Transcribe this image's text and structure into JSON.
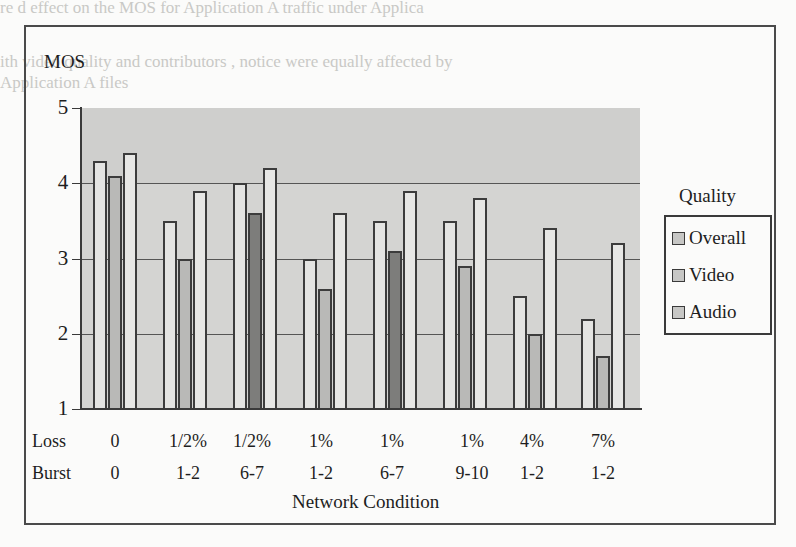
{
  "page": {
    "ghost_text": [
      "re d     effect on the MOS for Application A traffic under Applica",
      "ith video quality and contributors , notice were equally affected by",
      "Application A files"
    ]
  },
  "chart_data": {
    "type": "bar",
    "title": "",
    "ylabel": "MOS",
    "xlabel": "Network Condition",
    "ylim": [
      1,
      5
    ],
    "yticks": [
      1,
      2,
      3,
      4,
      5
    ],
    "grid": true,
    "legend_title": "Quality",
    "legend_position": "right",
    "row_labels": [
      "Loss",
      "Burst"
    ],
    "categories": [
      {
        "loss": "0",
        "burst": "0"
      },
      {
        "loss": "1/2%",
        "burst": "1-2"
      },
      {
        "loss": "1/2%",
        "burst": "6-7"
      },
      {
        "loss": "1%",
        "burst": "1-2"
      },
      {
        "loss": "1%",
        "burst": "6-7"
      },
      {
        "loss": "1%",
        "burst": "9-10"
      },
      {
        "loss": "4%",
        "burst": "1-2"
      },
      {
        "loss": "7%",
        "burst": "1-2"
      }
    ],
    "series": [
      {
        "name": "Overall",
        "values": [
          4.3,
          3.5,
          4.0,
          3.0,
          3.5,
          3.5,
          2.5,
          2.2
        ]
      },
      {
        "name": "Video",
        "values": [
          4.1,
          3.0,
          3.6,
          2.6,
          3.1,
          2.9,
          2.0,
          1.7
        ]
      },
      {
        "name": "Audio",
        "values": [
          4.4,
          3.9,
          4.2,
          3.6,
          3.9,
          3.8,
          3.4,
          3.2
        ]
      }
    ]
  }
}
